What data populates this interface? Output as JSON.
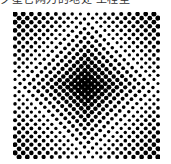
{
  "caption": {
    "text": "夕星它网刀的地处 工程型"
  },
  "artwork": {
    "name": "op-art checkerboard bulge",
    "grid_size": 21,
    "colors": {
      "dark": "#000000",
      "light": "#ffffff"
    }
  }
}
